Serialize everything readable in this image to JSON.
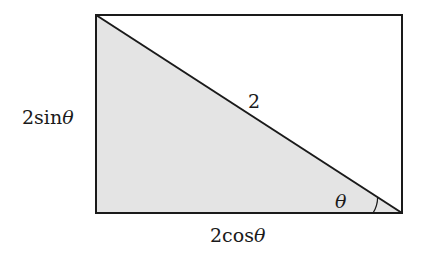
{
  "diagram": {
    "type": "right-triangle-in-rectangle",
    "rectangle": {
      "x1": 96,
      "y1": 15,
      "x2": 402,
      "y2": 213
    },
    "colors": {
      "stroke": "#1a1a1a",
      "fill": "#e4e4e4",
      "background": "#ffffff"
    },
    "labels": {
      "left_side": "2sin",
      "bottom_side": "2cos",
      "hypotenuse": "2",
      "angle": "θ",
      "theta": "θ"
    }
  }
}
